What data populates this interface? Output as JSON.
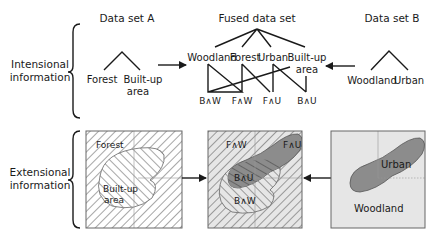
{
  "row_labels": {
    "intensional": [
      "Intensional",
      "information"
    ],
    "extensional": [
      "Extensional",
      "information"
    ]
  },
  "headers": {
    "dataset_a": "Data set A",
    "fused": "Fused data set",
    "dataset_b": "Data set B"
  },
  "tree_a": {
    "children": [
      "Forest",
      "Built-up",
      "area"
    ]
  },
  "tree_fused": {
    "children": [
      "Woodland",
      "Forest",
      "Urban",
      "Built-up",
      "area"
    ],
    "leaves": [
      "B∧W",
      "F∧W",
      "F∧U",
      "B∧U"
    ]
  },
  "tree_b": {
    "children": [
      "Woodland",
      "Urban"
    ]
  },
  "map_a": {
    "labels": [
      "Forest",
      "Built-up",
      "area"
    ]
  },
  "map_fused": {
    "labels": [
      "F∧W",
      "F∧U",
      "B∧U",
      "B∧W"
    ]
  },
  "map_b": {
    "labels": [
      "Urban",
      "Woodland"
    ]
  },
  "colors": {
    "urban_fill": "#8c8c8c",
    "map_b_bg": "#e6e6e6",
    "hatch": "#4d4d4d"
  }
}
